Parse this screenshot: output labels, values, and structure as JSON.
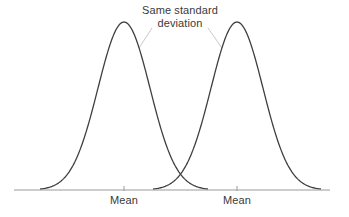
{
  "figure": {
    "title": "",
    "background_color": "#ffffff",
    "annotation": {
      "line1": "Same standard",
      "line2": "deviation"
    },
    "axis": {
      "left_tick_label": "Mean",
      "right_tick_label": "Mean"
    }
  },
  "colors": {
    "curve": "#3f3f3f",
    "axis": "#9a9a9a",
    "leader": "#c9c9c9",
    "text": "#3a3a3a",
    "background": "#ffffff"
  },
  "chart_data": {
    "type": "line",
    "title": "",
    "subtitle": "",
    "xlabel": "",
    "ylabel": "",
    "grid": false,
    "legend_position": "none",
    "xlim": [
      0,
      349
    ],
    "ylim": [
      0,
      217
    ],
    "annotations": [
      {
        "text": "Same standard deviation",
        "x": 180,
        "y": 16,
        "leader_lines": [
          {
            "from_x": 152,
            "from_y": 28,
            "to_x": 139,
            "to_y": 48
          },
          {
            "from_x": 208,
            "from_y": 28,
            "to_x": 222,
            "to_y": 48
          }
        ]
      }
    ],
    "axis_line": {
      "x_start": 14,
      "x_end": 330,
      "y": 190
    },
    "ticks": [
      {
        "x": 124,
        "label": "Mean"
      },
      {
        "x": 237,
        "label": "Mean"
      }
    ],
    "series": [
      {
        "name": "distribution-left",
        "distribution": "normal",
        "mean_x": 124,
        "std_px": 26,
        "peak_y": 22,
        "baseline_y": 190,
        "x_start": 40,
        "x_end": 208
      },
      {
        "name": "distribution-right",
        "distribution": "normal",
        "mean_x": 237,
        "std_px": 26,
        "peak_y": 22,
        "baseline_y": 190,
        "x_start": 153,
        "x_end": 321
      }
    ]
  }
}
